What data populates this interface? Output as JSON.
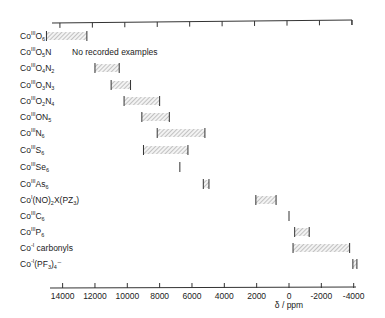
{
  "chart_data": {
    "type": "range-bar",
    "title": "",
    "xlabel": "δ / ppm",
    "ylabel": "",
    "x_reversed": true,
    "xlim": [
      15000,
      -4200
    ],
    "x_ticks": [
      14000,
      12000,
      10000,
      8000,
      6000,
      4000,
      2000,
      0,
      -2000,
      -4000
    ],
    "x_tick_labels": [
      "14000",
      "12000",
      "10000",
      "8000",
      "6000",
      "4000",
      "2000",
      "0",
      "-2000",
      "-4000"
    ],
    "top_axis": true,
    "grid": false,
    "legend": null,
    "rows": [
      {
        "id": "co3-o6",
        "label": {
          "base": "Co",
          "ox": "III",
          "parts": [
            [
              "O",
              ""
            ],
            [
              "",
              "6"
            ]
          ]
        },
        "text": "CoIII O6",
        "range": [
          15000,
          12500
        ]
      },
      {
        "id": "co3-o5n",
        "label": {
          "base": "Co",
          "ox": "III",
          "parts": [
            [
              "O",
              ""
            ],
            [
              "",
              "5"
            ],
            [
              "N",
              ""
            ]
          ]
        },
        "text": "CoIII O5N",
        "range": null,
        "note": "No recorded examples"
      },
      {
        "id": "co3-o4n2",
        "label": {
          "base": "Co",
          "ox": "III",
          "parts": [
            [
              "O",
              ""
            ],
            [
              "",
              "4"
            ],
            [
              "N",
              ""
            ],
            [
              "",
              "2"
            ]
          ]
        },
        "text": "CoIII O4N2",
        "range": [
          12000,
          10500
        ]
      },
      {
        "id": "co3-o3n3",
        "label": {
          "base": "Co",
          "ox": "III",
          "parts": [
            [
              "O",
              ""
            ],
            [
              "",
              "3"
            ],
            [
              "N",
              ""
            ],
            [
              "",
              "3"
            ]
          ]
        },
        "text": "CoIII O3N3",
        "range": [
          11000,
          9800
        ]
      },
      {
        "id": "co3-o2n4",
        "label": {
          "base": "Co",
          "ox": "III",
          "parts": [
            [
              "O",
              ""
            ],
            [
              "",
              "2"
            ],
            [
              "N",
              ""
            ],
            [
              "",
              "4"
            ]
          ]
        },
        "text": "CoIII O2N4",
        "range": [
          10200,
          8000
        ]
      },
      {
        "id": "co3-on5",
        "label": {
          "base": "Co",
          "ox": "III",
          "parts": [
            [
              "ON",
              ""
            ],
            [
              "",
              "5"
            ]
          ]
        },
        "text": "CoIII ON5",
        "range": [
          9100,
          7400
        ]
      },
      {
        "id": "co3-n6",
        "label": {
          "base": "Co",
          "ox": "III",
          "parts": [
            [
              "N",
              ""
            ],
            [
              "",
              "6"
            ]
          ]
        },
        "text": "CoIII N6",
        "range": [
          8150,
          5200
        ]
      },
      {
        "id": "co3-s6",
        "label": {
          "base": "Co",
          "ox": "III",
          "parts": [
            [
              "S",
              ""
            ],
            [
              "",
              "6"
            ]
          ]
        },
        "text": "CoIII S6",
        "range": [
          9000,
          6250
        ]
      },
      {
        "id": "co3-se6",
        "label": {
          "base": "Co",
          "ox": "III",
          "parts": [
            [
              "Se",
              ""
            ],
            [
              "",
              "6"
            ]
          ]
        },
        "text": "CoIII Se6",
        "range": [
          6750,
          6750
        ]
      },
      {
        "id": "co3-as6",
        "label": {
          "base": "Co",
          "ox": "III",
          "parts": [
            [
              "As",
              ""
            ],
            [
              "",
              "6"
            ]
          ]
        },
        "text": "CoIII As6",
        "range": [
          5300,
          4950
        ]
      },
      {
        "id": "co1-no",
        "label": {
          "base": "Co",
          "ox": "I",
          "parts": [
            [
              "(NO)",
              ""
            ],
            [
              "",
              "2"
            ],
            [
              "X(PZ",
              ""
            ],
            [
              "",
              "3"
            ],
            [
              ")",
              ""
            ]
          ]
        },
        "text": "CoI (NO)2X(PZ3)",
        "range": [
          2050,
          800
        ]
      },
      {
        "id": "co3-c6",
        "label": {
          "base": "Co",
          "ox": "III",
          "parts": [
            [
              "C",
              ""
            ],
            [
              "",
              "6"
            ]
          ]
        },
        "text": "CoIII C6",
        "range": [
          0,
          0
        ]
      },
      {
        "id": "co3-p6",
        "label": {
          "base": "Co",
          "ox": "III",
          "parts": [
            [
              "P",
              ""
            ],
            [
              "",
              "6"
            ]
          ]
        },
        "text": "CoIII P6",
        "range": [
          -350,
          -1250
        ]
      },
      {
        "id": "co-1-carb",
        "label": {
          "base": "Co",
          "ox": "-I",
          "parts": [
            [
              " carbonyls",
              ""
            ]
          ]
        },
        "text": "Co-I carbonyls",
        "range": [
          -250,
          -3750
        ]
      },
      {
        "id": "co-1-pf3",
        "label": {
          "base": "Co",
          "ox": "-I",
          "parts": [
            [
              "(PF",
              ""
            ],
            [
              "",
              "3"
            ],
            [
              ")",
              ""
            ],
            [
              "",
              "4"
            ],
            [
              "⁻",
              ""
            ]
          ]
        },
        "text": "Co-I (PF3)4-",
        "range": [
          -3950,
          -4200
        ]
      }
    ]
  },
  "axis": {
    "xlabel": "δ / ppm"
  }
}
